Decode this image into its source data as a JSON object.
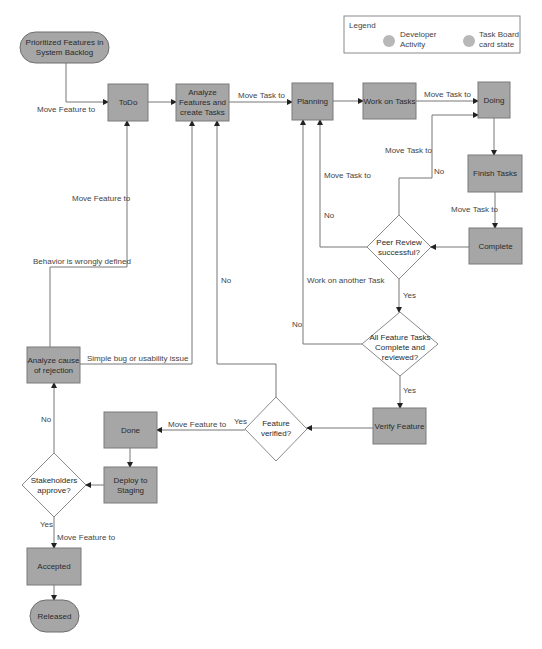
{
  "legend": {
    "title": "Legend",
    "items": [
      {
        "label_line1": "Developer",
        "label_line2": "Activity",
        "color": "#b8b8b8"
      },
      {
        "label_line1": "Task Board",
        "label_line2": "card state",
        "color": "#b8b8b8"
      }
    ]
  },
  "nodes": {
    "backlog": {
      "line1": "Prioritized Features in",
      "line2": "System Backlog",
      "shape": "terminal"
    },
    "todo": {
      "label": "ToDo",
      "shape": "box"
    },
    "analyze_features": {
      "line1": "Analyze",
      "line2": "Features and",
      "line3": "create Tasks",
      "shape": "box"
    },
    "planning": {
      "label": "Planning",
      "shape": "box"
    },
    "work_on_tasks": {
      "label": "Work on Tasks",
      "shape": "box"
    },
    "doing": {
      "label": "Doing",
      "shape": "box"
    },
    "finish_tasks": {
      "label": "Finish Tasks",
      "shape": "box"
    },
    "complete": {
      "label": "Complete",
      "shape": "box"
    },
    "peer_review": {
      "line1": "Peer Review",
      "line2": "successful?",
      "shape": "decision"
    },
    "all_feature_tasks": {
      "line1": "All Feature Tasks",
      "line2": "Complete and",
      "line3": "reviewed?",
      "shape": "decision"
    },
    "verify_feature": {
      "label": "Verify Feature",
      "shape": "box"
    },
    "feature_verified": {
      "line1": "Feature",
      "line2": "verified?",
      "shape": "decision"
    },
    "done": {
      "label": "Done",
      "shape": "box"
    },
    "deploy_staging": {
      "line1": "Deploy to",
      "line2": "Staging",
      "shape": "box"
    },
    "stakeholders": {
      "line1": "Stakeholders",
      "line2": "approve?",
      "shape": "decision"
    },
    "analyze_rejection": {
      "line1": "Analyze cause",
      "line2": "of rejection",
      "shape": "box"
    },
    "accepted": {
      "label": "Accepted",
      "shape": "box"
    },
    "released": {
      "label": "Released",
      "shape": "terminal"
    }
  },
  "edge_labels": {
    "backlog_to_todo": "Move Feature to",
    "analyze_to_planning": "Move Task to",
    "work_to_doing": "Move Task to",
    "peer_no_to_doing_move": "Move Task to",
    "peer_no_to_doing_no": "No",
    "finish_to_complete": "Move Task to",
    "peer_to_planning_move": "Move Task to",
    "peer_to_planning_no": "No",
    "peer_yes": "Yes",
    "work_another_task": "Work on another Task",
    "all_tasks_no": "No",
    "all_tasks_yes": "Yes",
    "feature_verified_no": "No",
    "feature_verified_yes": "Yes",
    "verified_to_done": "Move Feature to",
    "rejection_to_todo_move": "Move Feature to",
    "behavior_wrong": "Behavior is wrongly defined",
    "simple_bug": "Simple bug or usability issue",
    "stakeholders_no": "No",
    "stakeholders_yes": "Yes",
    "stakeholders_to_accepted": "Move Feature to"
  },
  "colors": {
    "node_fill": "#a6a6a6",
    "edge": "#777777",
    "text": "#2a2a2a"
  }
}
